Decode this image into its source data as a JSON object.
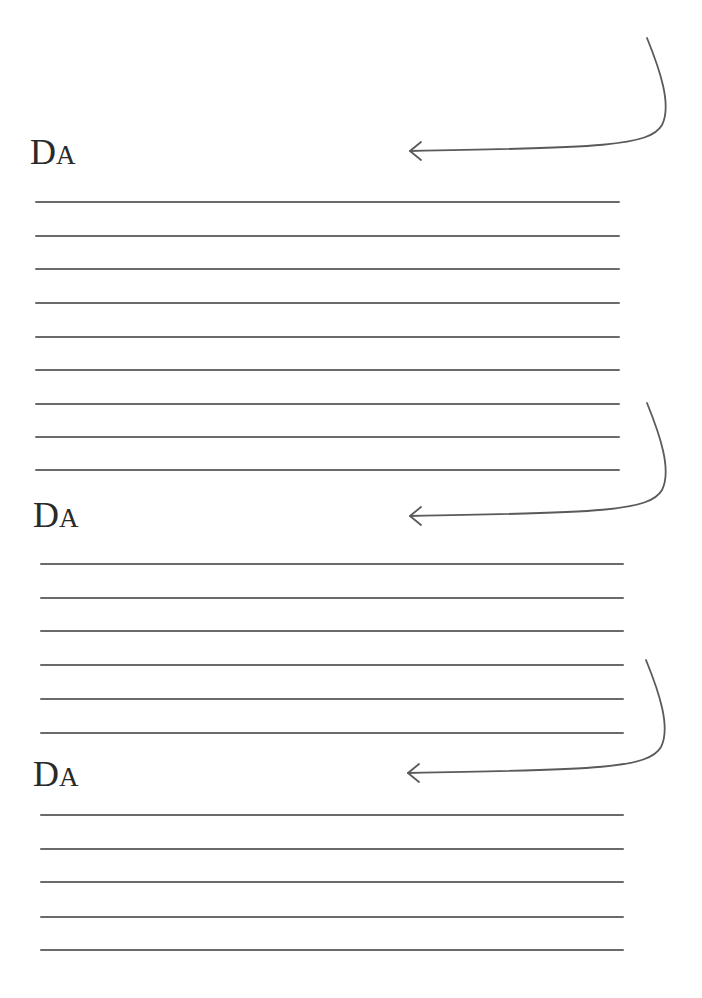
{
  "sections": [
    {
      "label_first": "D",
      "label_rest": "A",
      "label": "DA",
      "label_pos": {
        "x": 30,
        "y": 134
      },
      "line_count": 9,
      "lines_y": [
        202,
        236,
        269,
        303,
        337,
        370,
        404,
        437,
        470
      ],
      "line_x_start": 35,
      "line_x_end": 620,
      "arrow": "curved-arrow-left",
      "arrow_path": "M647,38 C660,70 672,105 662,125 C650,146 600,148 410,151",
      "arrowhead": {
        "tip_x": 410,
        "tip_y": 151
      }
    },
    {
      "label_first": "D",
      "label_rest": "A",
      "label": "DA",
      "label_pos": {
        "x": 33,
        "y": 497
      },
      "line_count": 6,
      "lines_y": [
        564,
        598,
        631,
        665,
        699,
        733
      ],
      "line_x_start": 40,
      "line_x_end": 624,
      "arrow": "curved-arrow-left",
      "arrow_path": "M647,403 C660,435 672,470 662,490 C650,511 600,513 410,516",
      "arrowhead": {
        "tip_x": 410,
        "tip_y": 516
      }
    },
    {
      "label_first": "D",
      "label_rest": "A",
      "label": "DA",
      "label_pos": {
        "x": 33,
        "y": 756
      },
      "line_count": 5,
      "lines_y": [
        815,
        849,
        882,
        917,
        950
      ],
      "line_x_start": 40,
      "line_x_end": 624,
      "arrow": "curved-arrow-left",
      "arrow_path": "M646,660 C659,692 671,727 661,747 C649,768 599,770 408,773",
      "arrowhead": {
        "tip_x": 408,
        "tip_y": 773
      }
    }
  ],
  "colors": {
    "background": "#ffffff",
    "ink": "#2a2a2a",
    "rule": "#6a6a6a",
    "arrow": "#5a5a5a"
  }
}
